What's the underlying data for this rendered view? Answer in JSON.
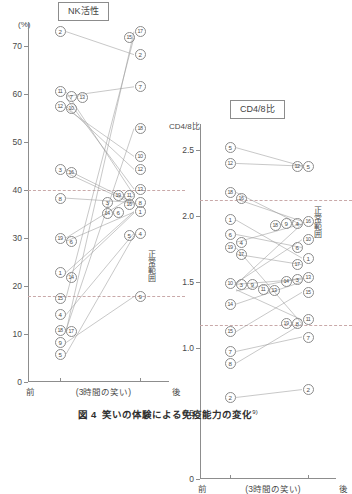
{
  "caption": {
    "figure_number": "図 4",
    "text": "笑いの体験による免疫能力の変化",
    "reference": "9)"
  },
  "panels": [
    {
      "key": "nk",
      "title": "NK活性",
      "axis_unit": "(%)",
      "x_before": "前",
      "x_middle": "(3時間の笑い)",
      "x_after": "後",
      "normal_range_label": "正常範囲"
    },
    {
      "key": "cd",
      "title": "CD4/8比",
      "axis_unit": "CD4/8比",
      "x_before": "前",
      "x_middle": "(3時間の笑い)",
      "x_after": "後",
      "normal_range_label": "正常範囲"
    }
  ],
  "chart_data": [
    {
      "type": "line",
      "id": "nk-activity",
      "title": "NK活性",
      "xlabel": "(3時間の笑い)",
      "ylabel": "(%)",
      "categories": [
        "前",
        "後"
      ],
      "ylim": [
        0,
        75
      ],
      "yticks": [
        0,
        10,
        20,
        30,
        40,
        50,
        60,
        70
      ],
      "ytick_labels": [
        "0",
        "10",
        "20",
        "30",
        "40",
        "50",
        "60",
        "70"
      ],
      "grid": false,
      "legend": "none",
      "normal_range": [
        18,
        40
      ],
      "normal_range_label": "正常範囲",
      "series": [
        {
          "name": "1",
          "values": [
            22.8,
            35.5
          ]
        },
        {
          "name": "2",
          "values": [
            73.0,
            68.2
          ]
        },
        {
          "name": "3",
          "values": [
            44.3,
            37.3
          ]
        },
        {
          "name": "4",
          "values": [
            14.0,
            31.0
          ]
        },
        {
          "name": "5",
          "values": [
            5.8,
            30.5
          ]
        },
        {
          "name": "6",
          "values": [
            29.3,
            35.4
          ]
        },
        {
          "name": "7",
          "values": [
            59.5,
            61.5
          ]
        },
        {
          "name": "8",
          "values": [
            38.3,
            37.4
          ]
        },
        {
          "name": "9",
          "values": [
            8.2,
            17.8
          ]
        },
        {
          "name": "10",
          "values": [
            57.0,
            47.0
          ]
        },
        {
          "name": "11",
          "values": [
            60.5,
            38.9
          ]
        },
        {
          "name": "12",
          "values": [
            57.5,
            44.3
          ]
        },
        {
          "name": "13",
          "values": [
            59.2,
            40.2
          ]
        },
        {
          "name": "14",
          "values": [
            21.8,
            35.2
          ]
        },
        {
          "name": "15",
          "values": [
            17.5,
            71.8
          ]
        },
        {
          "name": "16",
          "values": [
            43.6,
            37.0
          ]
        },
        {
          "name": "17",
          "values": [
            10.5,
            73.0
          ]
        },
        {
          "name": "18",
          "values": [
            10.8,
            52.8
          ]
        },
        {
          "name": "19",
          "values": [
            30.0,
            38.8
          ]
        }
      ]
    },
    {
      "type": "line",
      "id": "cd4-8-ratio",
      "title": "CD4/8比",
      "xlabel": "(3時間の笑い)",
      "ylabel": "CD4/8比",
      "categories": [
        "前",
        "後"
      ],
      "ylim": [
        0,
        2.7
      ],
      "yticks": [
        0,
        0.5,
        1.0,
        1.5,
        2.0,
        2.5
      ],
      "ytick_labels": [
        "0",
        "0.5",
        "1.0",
        "1.5",
        "2.0",
        "2.5"
      ],
      "grid": false,
      "legend": "none",
      "normal_range": [
        1.17,
        2.12
      ],
      "normal_range_label": "正常範囲",
      "series": [
        {
          "name": "1",
          "values": [
            1.97,
            1.68
          ]
        },
        {
          "name": "2",
          "values": [
            0.62,
            0.68
          ]
        },
        {
          "name": "3",
          "values": [
            1.48,
            1.52
          ]
        },
        {
          "name": "4",
          "values": [
            1.8,
            1.94
          ]
        },
        {
          "name": "5",
          "values": [
            2.52,
            2.38
          ]
        },
        {
          "name": "6",
          "values": [
            1.86,
            1.76
          ]
        },
        {
          "name": "7",
          "values": [
            0.97,
            1.08
          ]
        },
        {
          "name": "8",
          "values": [
            0.88,
            1.18
          ]
        },
        {
          "name": "9",
          "values": [
            1.48,
            1.94
          ]
        },
        {
          "name": "10",
          "values": [
            1.49,
            1.82
          ]
        },
        {
          "name": "11",
          "values": [
            1.44,
            1.21
          ]
        },
        {
          "name": "12",
          "values": [
            2.4,
            2.38
          ]
        },
        {
          "name": "13",
          "values": [
            1.43,
            1.53
          ]
        },
        {
          "name": "14",
          "values": [
            1.33,
            1.5
          ]
        },
        {
          "name": "15",
          "values": [
            1.12,
            1.42
          ]
        },
        {
          "name": "16",
          "values": [
            2.13,
            1.96
          ]
        },
        {
          "name": "17",
          "values": [
            1.71,
            1.63
          ]
        },
        {
          "name": "18",
          "values": [
            2.18,
            1.93
          ]
        },
        {
          "name": "19",
          "values": [
            1.76,
            1.18
          ]
        }
      ]
    }
  ]
}
